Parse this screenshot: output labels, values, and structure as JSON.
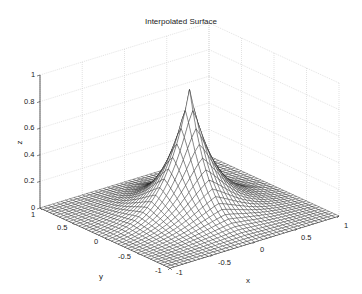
{
  "chart_data": {
    "type": "surface",
    "title": "Interpolated Surface",
    "xlabel": "x",
    "ylabel": "y",
    "zlabel": "z",
    "xlim": [
      -1,
      1
    ],
    "ylim": [
      -1,
      1
    ],
    "zlim": [
      0,
      1
    ],
    "xticks": [
      "-1",
      "-0.5",
      "0",
      "0.5",
      "1"
    ],
    "yticks": [
      "-1",
      "-0.5",
      "0",
      "0.5",
      "1"
    ],
    "zticks": [
      "0",
      "0.2",
      "0.4",
      "0.6",
      "0.8",
      "1"
    ],
    "grid": true,
    "mesh_resolution": 41,
    "peak": {
      "x": 0,
      "y": 0,
      "z": 0.9
    },
    "surface_description": "Sharp cusp peak at origin (z≈0.9) decaying toward corners (z≈0) — interpolated mesh surface",
    "colors": {
      "mesh_line": "#111111",
      "face": "#ffffff",
      "grid": "#cfcfcf",
      "axis": "#333333"
    }
  }
}
